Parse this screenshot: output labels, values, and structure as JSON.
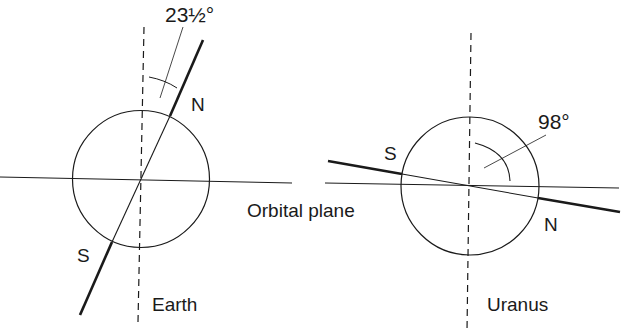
{
  "diagram": {
    "colors": {
      "ink": "#1a1a1a",
      "background": "#ffffff"
    },
    "shared": {
      "orbital_plane_label": "Orbital plane"
    },
    "earth": {
      "name": "Earth",
      "tilt_label": "23½°",
      "north_label": "N",
      "south_label": "S"
    },
    "uranus": {
      "name": "Uranus",
      "tilt_label": "98°",
      "north_label": "N",
      "south_label": "S"
    }
  }
}
